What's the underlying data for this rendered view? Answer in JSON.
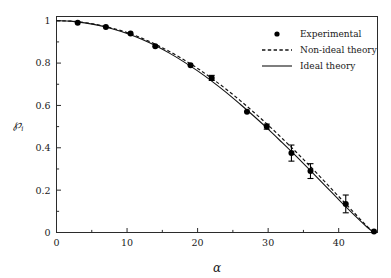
{
  "chart_data": {
    "type": "scatter",
    "title": "",
    "subtitle": "",
    "xlabel": "α",
    "ylabel": "℘",
    "ylabel_subscript": "i",
    "xlim": [
      0,
      45.5
    ],
    "ylim": [
      0,
      1.02
    ],
    "xticks": [
      0,
      10,
      20,
      30,
      40
    ],
    "xticklabels": [
      "0",
      "10",
      "20",
      "30",
      "40"
    ],
    "xminorticks": [
      5,
      15,
      25,
      35,
      45
    ],
    "yticks": [
      0,
      0.2,
      0.4,
      0.6,
      0.8,
      1
    ],
    "yticklabels": [
      "0",
      "0.2",
      "0.4",
      "0.6",
      "0.8",
      "1"
    ],
    "yminorticks": [
      0.1,
      0.3,
      0.5,
      0.7,
      0.9
    ],
    "grid": false,
    "legend_position": "top-right",
    "frame": true,
    "series": [
      {
        "name": "Experimental",
        "type": "scatter",
        "marker": "filled-circle",
        "color": "#000000",
        "x": [
          3.0,
          7.0,
          10.5,
          14.0,
          19.0,
          22.0,
          27.0,
          29.8,
          33.3,
          36.0,
          41.0,
          45.0
        ],
        "y": [
          0.99,
          0.97,
          0.94,
          0.88,
          0.79,
          0.73,
          0.57,
          0.5,
          0.375,
          0.29,
          0.135,
          0.005
        ],
        "yerr": [
          0.0,
          0.0,
          0.0,
          0.0,
          0.0,
          0.012,
          0.0,
          0.012,
          0.038,
          0.035,
          0.042,
          0.0
        ]
      },
      {
        "name": "Non-ideal theory",
        "type": "line",
        "linestyle": "dashed",
        "color": "#000000",
        "x": [
          0,
          2,
          4,
          6,
          8,
          10,
          12,
          14,
          16,
          18,
          20,
          22,
          24,
          26,
          28,
          30,
          32,
          34,
          36,
          38,
          40,
          42,
          44,
          45
        ],
        "y": [
          1.0,
          0.998,
          0.991,
          0.98,
          0.964,
          0.944,
          0.919,
          0.889,
          0.855,
          0.817,
          0.775,
          0.728,
          0.678,
          0.624,
          0.567,
          0.507,
          0.444,
          0.379,
          0.311,
          0.241,
          0.17,
          0.1,
          0.03,
          0.0
        ]
      },
      {
        "name": "Ideal theory",
        "type": "line",
        "linestyle": "solid",
        "color": "#000000",
        "x": [
          0,
          2,
          4,
          6,
          8,
          10,
          12,
          14,
          16,
          18,
          20,
          22,
          24,
          26,
          28,
          30,
          32,
          34,
          36,
          38,
          40,
          42,
          44,
          45
        ],
        "y": [
          1.0,
          0.998,
          0.99,
          0.978,
          0.961,
          0.94,
          0.914,
          0.883,
          0.847,
          0.807,
          0.763,
          0.715,
          0.663,
          0.607,
          0.549,
          0.488,
          0.424,
          0.359,
          0.292,
          0.224,
          0.155,
          0.089,
          0.026,
          0.0
        ]
      }
    ]
  },
  "legend": {
    "entries": [
      {
        "label": "Experimental",
        "marker": "filled-circle"
      },
      {
        "label": "Non-ideal theory",
        "marker": "dashed-line"
      },
      {
        "label": "Ideal theory",
        "marker": "solid-line"
      }
    ]
  },
  "axes": {
    "x_label": "α",
    "y_label": "℘",
    "y_label_sub": "i"
  }
}
